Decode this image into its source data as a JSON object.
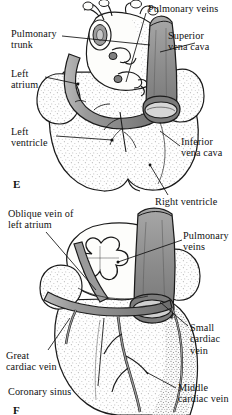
{
  "figure": {
    "style": "pen-and-ink stipple anatomical illustration, grayscale",
    "colors": {
      "ink": "#1a1a1a",
      "vessel_shade": "#8d8d8d",
      "vessel_shade_dark": "#6f6f6f",
      "chamber_fill": "#fdfdfb",
      "stipple": "#6b6b6b",
      "background": "#ffffff"
    }
  },
  "panels": [
    {
      "letter": "E",
      "view": "anterior",
      "labels": [
        {
          "id": "pulmonary-trunk",
          "text": "Pulmonary\ntrunk"
        },
        {
          "id": "left-atrium",
          "text": "Left\natrium"
        },
        {
          "id": "left-ventricle",
          "text": "Left\nventricle"
        },
        {
          "id": "pulmonary-veins",
          "text": "Pulmonary veins"
        },
        {
          "id": "superior-vena-cava",
          "text": "Superior\nvena cava"
        },
        {
          "id": "inferior-vena-cava",
          "text": "Inferior\nvena cava"
        },
        {
          "id": "right-ventricle",
          "text": "Right ventricle"
        }
      ]
    },
    {
      "letter": "F",
      "view": "posterior",
      "labels": [
        {
          "id": "oblique-vein-left-atrium",
          "text": "Oblique vein of\nleft atrium"
        },
        {
          "id": "pulmonary-veins-2",
          "text": "Pulmonary\nveins"
        },
        {
          "id": "small-cardiac-vein",
          "text": "Small\ncardiac\nvein"
        },
        {
          "id": "great-cardiac-vein",
          "text": "Great\ncardiac vein"
        },
        {
          "id": "middle-cardiac-vein",
          "text": "Middle\ncardiac vein"
        },
        {
          "id": "coronary-sinus",
          "text": "Coronary sinus"
        }
      ]
    }
  ]
}
